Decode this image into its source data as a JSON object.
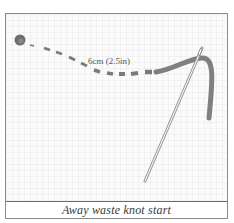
{
  "figure": {
    "caption": "Away waste knot start",
    "measurement_label": "6cm (2.5in)",
    "elements": {
      "knot": {
        "icon": "knot-icon",
        "color": "#6e6e6e"
      },
      "dashed_thread": {
        "icon": "dashed-thread-icon",
        "color": "#7a7a7a"
      },
      "thread": {
        "icon": "thread-icon",
        "color": "#808080"
      },
      "needle": {
        "icon": "needle-icon",
        "color": "#9a9a9a"
      }
    },
    "colors": {
      "frame_border": "#8a8a8a",
      "background": "#fbfbfb",
      "caption_text": "#3a3a3a"
    }
  }
}
